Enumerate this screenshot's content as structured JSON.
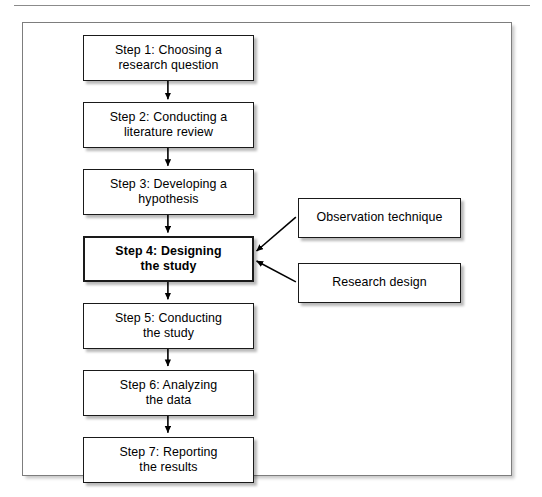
{
  "page": {
    "caption_rule": true,
    "caption_fragment": ""
  },
  "figure": {
    "title": "",
    "frame": {
      "border_color": "#7d7d7d",
      "background": "#ffffff"
    },
    "box_border_color": "#1a1a1a",
    "text_color": "#000000",
    "arrow_color": "#000000"
  },
  "flowchart": {
    "type": "diagram",
    "orientation": "vertical",
    "main_steps": [
      {
        "id": "step1",
        "label": "Step 1: Choosing a\nresearch question",
        "emphasis": false
      },
      {
        "id": "step2",
        "label": "Step 2: Conducting a\nliterature review",
        "emphasis": false
      },
      {
        "id": "step3",
        "label": "Step 3: Developing a\nhypothesis",
        "emphasis": false
      },
      {
        "id": "step4",
        "label": "Step 4: Designing\nthe study",
        "emphasis": true
      },
      {
        "id": "step5",
        "label": "Step 5: Conducting\nthe study",
        "emphasis": false
      },
      {
        "id": "step6",
        "label": "Step 6: Analyzing\nthe data",
        "emphasis": false
      },
      {
        "id": "step7",
        "label": "Step 7: Reporting\nthe results",
        "emphasis": false
      }
    ],
    "side_nodes": [
      {
        "id": "observation",
        "label": "Observation technique",
        "targets": "step4"
      },
      {
        "id": "research_design",
        "label": "Research design",
        "targets": "step4"
      }
    ],
    "connections": [
      {
        "from": "step1",
        "to": "step2",
        "style": "arrow-down"
      },
      {
        "from": "step2",
        "to": "step3",
        "style": "arrow-down"
      },
      {
        "from": "step3",
        "to": "step4",
        "style": "arrow-down"
      },
      {
        "from": "step4",
        "to": "step5",
        "style": "arrow-down"
      },
      {
        "from": "step5",
        "to": "step6",
        "style": "arrow-down"
      },
      {
        "from": "step6",
        "to": "step7",
        "style": "arrow-down"
      },
      {
        "from": "observation",
        "to": "step4",
        "style": "arrow-diagonal-left"
      },
      {
        "from": "research_design",
        "to": "step4",
        "style": "arrow-diagonal-left"
      }
    ]
  }
}
